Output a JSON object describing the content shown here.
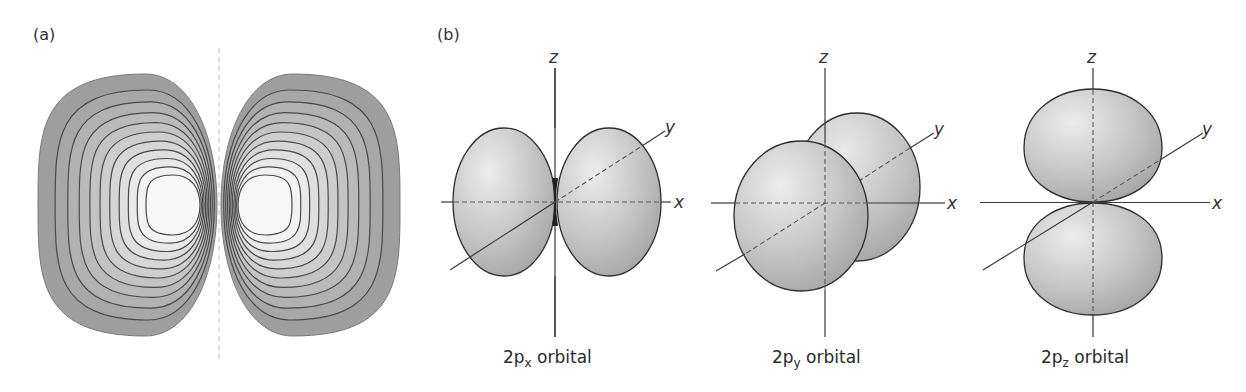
{
  "figure": {
    "panel_a": {
      "label": "(a)",
      "description": "Contour plot of 2p orbital amplitude with nodal plane",
      "contour_levels_per_lobe": 10,
      "colors": {
        "outer": "#9e9e9e",
        "inner": "#f7f7f7",
        "line": "#4a4a4a",
        "nodal_line": "#c4c4c4"
      }
    },
    "panel_b": {
      "label": "(b)",
      "orbitals": [
        {
          "name": "2px",
          "caption_main": "2p",
          "caption_sub": "x",
          "caption_rest": " orbital",
          "orientation": "x"
        },
        {
          "name": "2py",
          "caption_main": "2p",
          "caption_sub": "y",
          "caption_rest": " orbital",
          "orientation": "y"
        },
        {
          "name": "2pz",
          "caption_main": "2p",
          "caption_sub": "z",
          "caption_rest": " orbital",
          "orientation": "z"
        }
      ],
      "axis_labels": {
        "x": "x",
        "y": "y",
        "z": "z"
      },
      "colors": {
        "lobe_light": "#ececec",
        "lobe_dark": "#a4a4a4",
        "outline": "#2e2e2e",
        "axis": "#3a3a3a"
      }
    }
  }
}
